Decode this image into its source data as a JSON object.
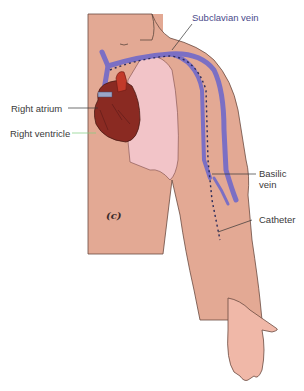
{
  "figure": {
    "panel_label": "(c)",
    "labels": {
      "subclavian_vein": "Subclavian vein",
      "right_atrium": "Right atrium",
      "right_ventricle": "Right ventricle",
      "basilic_vein": "Basilic vein",
      "basilic_line1": "Basilic",
      "basilic_line2": "vein",
      "catheter": "Catheter"
    },
    "colors": {
      "skin": "#e8b09a",
      "torso": "#e3a994",
      "lung": "#f2c4c8",
      "vein": "#7b6fc4",
      "heart": "#8a2a22",
      "outline": "#5a3a30",
      "leader_line": "#333333",
      "green_leader": "#7fcf7f"
    }
  }
}
